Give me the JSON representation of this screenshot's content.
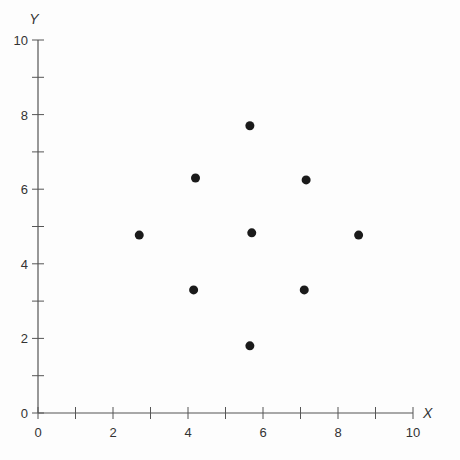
{
  "chart_data": {
    "type": "scatter",
    "title": "",
    "xlabel": "X",
    "ylabel": "Y",
    "xlim": [
      0,
      10
    ],
    "ylim": [
      0,
      10
    ],
    "x_major_ticks": [
      0,
      2,
      4,
      6,
      8,
      10
    ],
    "y_major_ticks": [
      0,
      2,
      4,
      6,
      8,
      10
    ],
    "minor_tick_step": 1,
    "grid": false,
    "legend": null,
    "points": [
      {
        "x": 5.65,
        "y": 7.7
      },
      {
        "x": 4.2,
        "y": 6.3
      },
      {
        "x": 7.15,
        "y": 6.25
      },
      {
        "x": 2.7,
        "y": 4.77
      },
      {
        "x": 5.7,
        "y": 4.83
      },
      {
        "x": 8.55,
        "y": 4.77
      },
      {
        "x": 4.15,
        "y": 3.3
      },
      {
        "x": 7.1,
        "y": 3.3
      },
      {
        "x": 5.65,
        "y": 1.8
      }
    ],
    "colors": {
      "axis": "#555555",
      "point": "#1a1a1a"
    }
  }
}
